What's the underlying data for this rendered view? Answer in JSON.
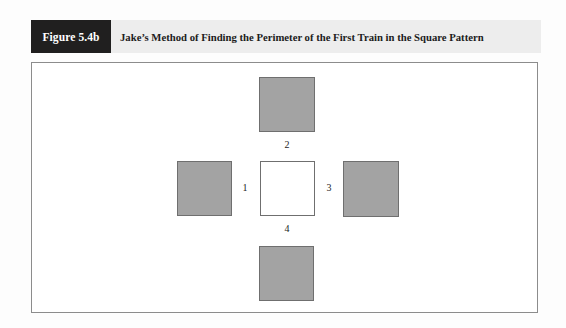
{
  "figure": {
    "tag": "Figure 5.4b",
    "caption": "Jake’s Method of Finding the Perimeter of the First Train in the Square Pattern"
  },
  "diagram": {
    "center_square": {
      "fill": "hollow",
      "color": "#ffffff"
    },
    "shaded_color": "#a3a3a3",
    "border_color": "#6f6f6f",
    "squares": [
      {
        "position": "top",
        "fill": "shaded"
      },
      {
        "position": "left",
        "fill": "shaded"
      },
      {
        "position": "center",
        "fill": "hollow"
      },
      {
        "position": "right",
        "fill": "shaded"
      },
      {
        "position": "bottom",
        "fill": "shaded"
      }
    ],
    "labels": [
      {
        "id": "1",
        "text": "1",
        "side": "left"
      },
      {
        "id": "2",
        "text": "2",
        "side": "top"
      },
      {
        "id": "3",
        "text": "3",
        "side": "right"
      },
      {
        "id": "4",
        "text": "4",
        "side": "bottom"
      }
    ]
  },
  "colors": {
    "tag_background": "#201f1f",
    "tag_text": "#ffffff",
    "caption_background": "#ededed",
    "panel_background": "#ffffff",
    "panel_border": "#8c8c8c",
    "page_background": "#fdfdfd"
  }
}
